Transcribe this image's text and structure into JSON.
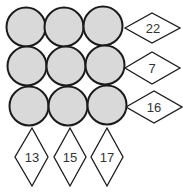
{
  "puzzle": {
    "grid_rows": 3,
    "grid_cols": 3,
    "circle_color": "#d9d9d9",
    "row_clues": [
      "22",
      "7",
      "16"
    ],
    "col_clues": [
      "13",
      "15",
      "17"
    ]
  }
}
